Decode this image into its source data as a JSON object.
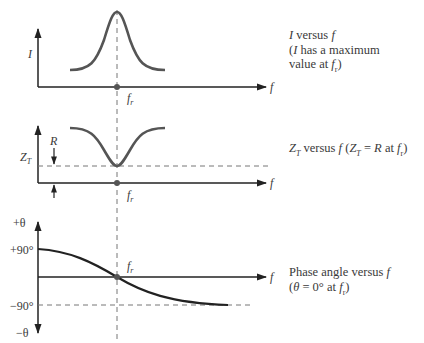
{
  "diagram": {
    "shared": {
      "x_axis_label": "f",
      "resonant_label": "fr"
    },
    "panels": [
      {
        "id": "current",
        "y_axis_label": "I",
        "x_axis_label": "f",
        "marker_label": "fr",
        "caption_line1": "I versus f",
        "caption_line2": "(I has a maximum",
        "caption_line3": "value at fr)",
        "curve": "peak at fr"
      },
      {
        "id": "impedance",
        "y_axis_label": "ZT",
        "x_axis_label": "f",
        "marker_label": "fr",
        "level_label": "R",
        "caption": "ZT versus f (ZT = R at fr)",
        "curve": "minimum equal to R at fr"
      },
      {
        "id": "phase",
        "y_axis_top_label": "+θ",
        "y_axis_bottom_label": "−θ",
        "tick_top": "+90°",
        "tick_bottom": "−90°",
        "x_axis_label": "f",
        "marker_label": "fr",
        "caption_line1": "Phase angle versus f",
        "caption_line2": "(θ = 0° at fr)",
        "curve": "decreasing from +90° through 0° at fr toward −90°"
      }
    ],
    "colors": {
      "curve": "#555555",
      "axis": "#222222",
      "dashed": "#777777",
      "text": "#3a3a3a"
    }
  }
}
